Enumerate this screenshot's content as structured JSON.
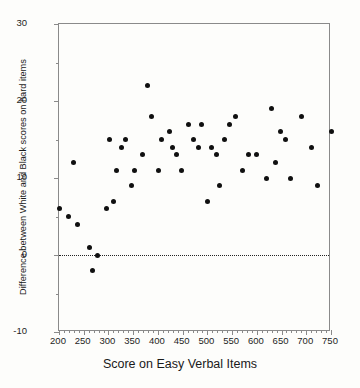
{
  "chart_data": {
    "type": "scatter",
    "title": "",
    "xlabel": "Score on Easy Verbal Items",
    "ylabel": "Difference between White and Black scores on hard items",
    "xlim": [
      200,
      750
    ],
    "ylim": [
      -10,
      30
    ],
    "xticks": [
      200,
      250,
      300,
      350,
      400,
      450,
      500,
      550,
      600,
      650,
      700,
      750
    ],
    "yticks": [
      -10,
      0,
      10,
      20,
      30
    ],
    "x_minor_step": 10,
    "y_minor_step": 5,
    "grid": false,
    "legend": null,
    "annotations": [
      {
        "type": "hline",
        "y": 0,
        "style": "dotted",
        "label": "zero-reference-line"
      }
    ],
    "marker": {
      "shape": "circle",
      "filled": true,
      "color": "#101010",
      "size": 5
    },
    "points": [
      {
        "x": 200,
        "y": 6
      },
      {
        "x": 220,
        "y": 5
      },
      {
        "x": 230,
        "y": 12
      },
      {
        "x": 238,
        "y": 4
      },
      {
        "x": 262,
        "y": 1
      },
      {
        "x": 268,
        "y": -2
      },
      {
        "x": 278,
        "y": 0
      },
      {
        "x": 296,
        "y": 6
      },
      {
        "x": 302,
        "y": 15
      },
      {
        "x": 310,
        "y": 7
      },
      {
        "x": 316,
        "y": 11
      },
      {
        "x": 326,
        "y": 14
      },
      {
        "x": 334,
        "y": 15
      },
      {
        "x": 346,
        "y": 9
      },
      {
        "x": 352,
        "y": 11
      },
      {
        "x": 368,
        "y": 13
      },
      {
        "x": 378,
        "y": 22
      },
      {
        "x": 388,
        "y": 18
      },
      {
        "x": 402,
        "y": 11
      },
      {
        "x": 408,
        "y": 15
      },
      {
        "x": 424,
        "y": 16
      },
      {
        "x": 430,
        "y": 14
      },
      {
        "x": 438,
        "y": 13
      },
      {
        "x": 448,
        "y": 11
      },
      {
        "x": 462,
        "y": 17
      },
      {
        "x": 472,
        "y": 15
      },
      {
        "x": 482,
        "y": 14
      },
      {
        "x": 488,
        "y": 17
      },
      {
        "x": 500,
        "y": 7
      },
      {
        "x": 508,
        "y": 14
      },
      {
        "x": 518,
        "y": 13
      },
      {
        "x": 524,
        "y": 9
      },
      {
        "x": 534,
        "y": 15
      },
      {
        "x": 544,
        "y": 17
      },
      {
        "x": 556,
        "y": 18
      },
      {
        "x": 572,
        "y": 11
      },
      {
        "x": 584,
        "y": 13
      },
      {
        "x": 600,
        "y": 13
      },
      {
        "x": 620,
        "y": 10
      },
      {
        "x": 630,
        "y": 19
      },
      {
        "x": 638,
        "y": 12
      },
      {
        "x": 648,
        "y": 16
      },
      {
        "x": 658,
        "y": 15
      },
      {
        "x": 668,
        "y": 10
      },
      {
        "x": 690,
        "y": 18
      },
      {
        "x": 710,
        "y": 14
      },
      {
        "x": 722,
        "y": 9
      },
      {
        "x": 750,
        "y": 16
      }
    ]
  }
}
